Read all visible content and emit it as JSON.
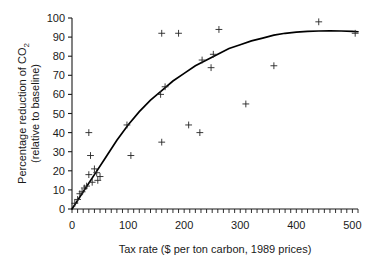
{
  "chart_data": {
    "type": "scatter",
    "title": "",
    "xlabel": "Tax rate ($ per ton carbon, 1989 prices)",
    "ylabel_line1": "Percentage reduction of CO",
    "ylabel_sub": "2",
    "ylabel_line2": "(relative to baseline)",
    "xlim": [
      0,
      510
    ],
    "ylim": [
      0,
      100
    ],
    "grid": false,
    "legend": null,
    "x_major_ticks": [
      0,
      100,
      200,
      300,
      400,
      500
    ],
    "x_major_labels": [
      "0",
      "100",
      "200",
      "300",
      "400",
      "500"
    ],
    "x_minor_step": 10,
    "y_ticks": [
      0,
      10,
      20,
      30,
      40,
      50,
      60,
      70,
      80,
      90,
      100
    ],
    "y_labels": [
      "0",
      "10",
      "20",
      "30",
      "40",
      "50",
      "60",
      "70",
      "80",
      "90",
      "100"
    ],
    "marker": "plus",
    "marker_color": "#262626",
    "points": [
      {
        "x": 5,
        "y": 3
      },
      {
        "x": 10,
        "y": 5
      },
      {
        "x": 14,
        "y": 8
      },
      {
        "x": 18,
        "y": 9
      },
      {
        "x": 22,
        "y": 11
      },
      {
        "x": 26,
        "y": 12
      },
      {
        "x": 30,
        "y": 40
      },
      {
        "x": 30,
        "y": 18
      },
      {
        "x": 33,
        "y": 28
      },
      {
        "x": 36,
        "y": 14
      },
      {
        "x": 40,
        "y": 21
      },
      {
        "x": 44,
        "y": 19
      },
      {
        "x": 46,
        "y": 15
      },
      {
        "x": 50,
        "y": 17
      },
      {
        "x": 98,
        "y": 44
      },
      {
        "x": 105,
        "y": 28
      },
      {
        "x": 158,
        "y": 60
      },
      {
        "x": 160,
        "y": 35
      },
      {
        "x": 166,
        "y": 64
      },
      {
        "x": 160,
        "y": 92
      },
      {
        "x": 190,
        "y": 92
      },
      {
        "x": 208,
        "y": 44
      },
      {
        "x": 228,
        "y": 40
      },
      {
        "x": 232,
        "y": 78
      },
      {
        "x": 248,
        "y": 74
      },
      {
        "x": 252,
        "y": 81
      },
      {
        "x": 262,
        "y": 94
      },
      {
        "x": 310,
        "y": 55
      },
      {
        "x": 360,
        "y": 75
      },
      {
        "x": 440,
        "y": 98
      },
      {
        "x": 505,
        "y": 92
      }
    ],
    "fit_curve": {
      "description": "saturating logistic fit rising from 0 to about 93",
      "points": [
        {
          "x": 0,
          "y": 0
        },
        {
          "x": 20,
          "y": 9
        },
        {
          "x": 40,
          "y": 18
        },
        {
          "x": 60,
          "y": 27
        },
        {
          "x": 80,
          "y": 36
        },
        {
          "x": 100,
          "y": 44
        },
        {
          "x": 120,
          "y": 51
        },
        {
          "x": 140,
          "y": 57
        },
        {
          "x": 160,
          "y": 62
        },
        {
          "x": 180,
          "y": 67
        },
        {
          "x": 200,
          "y": 71
        },
        {
          "x": 220,
          "y": 75
        },
        {
          "x": 240,
          "y": 78
        },
        {
          "x": 260,
          "y": 81
        },
        {
          "x": 280,
          "y": 84
        },
        {
          "x": 300,
          "y": 86
        },
        {
          "x": 320,
          "y": 88
        },
        {
          "x": 340,
          "y": 89.5
        },
        {
          "x": 360,
          "y": 91
        },
        {
          "x": 380,
          "y": 92
        },
        {
          "x": 400,
          "y": 92.6
        },
        {
          "x": 420,
          "y": 93
        },
        {
          "x": 440,
          "y": 93.2
        },
        {
          "x": 460,
          "y": 93.3
        },
        {
          "x": 480,
          "y": 93.2
        },
        {
          "x": 500,
          "y": 93
        },
        {
          "x": 510,
          "y": 92.8
        }
      ]
    }
  }
}
